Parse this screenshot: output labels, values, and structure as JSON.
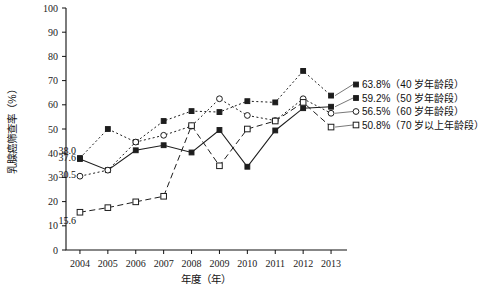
{
  "chart_data": {
    "type": "line",
    "title": "",
    "xlabel": "年度（年）",
    "ylabel": "乳腺癌筛查率（%）",
    "categories": [
      "2004",
      "2005",
      "2006",
      "2007",
      "2008",
      "2009",
      "2010",
      "2011",
      "2012",
      "2013"
    ],
    "x": [
      2004,
      2005,
      2006,
      2007,
      2008,
      2009,
      2010,
      2011,
      2012,
      2013
    ],
    "xlim": [
      2003.5,
      2013.5
    ],
    "ylim": [
      0,
      100
    ],
    "yticks": [
      0,
      10,
      20,
      30,
      40,
      50,
      60,
      70,
      80,
      90,
      100
    ],
    "ytick_labels": [
      "0",
      "10",
      "20",
      "30",
      "40",
      "50",
      "60",
      "70",
      "80",
      "90",
      "100"
    ],
    "grid": false,
    "legend_position": "right-inline",
    "series": [
      {
        "name": "40 岁年龄段",
        "end_label": "63.8%（40 岁年龄段）",
        "end_value": 63.8,
        "marker": "filled-square",
        "linestyle": "dotted",
        "values": [
          38.0,
          50.0,
          44.6,
          53.3,
          57.4,
          57.0,
          61.5,
          61.0,
          74.0,
          63.8
        ]
      },
      {
        "name": "50 岁年龄段",
        "end_label": "59.2%（50 岁年龄段）",
        "end_value": 59.2,
        "marker": "filled-square",
        "linestyle": "solid",
        "values": [
          37.6,
          33.0,
          41.2,
          43.3,
          40.3,
          49.6,
          34.4,
          49.4,
          58.6,
          59.2
        ]
      },
      {
        "name": "60 岁年龄段",
        "end_label": "56.5%（60 岁年龄段）",
        "end_value": 56.5,
        "marker": "open-circle",
        "linestyle": "dotted",
        "values": [
          30.5,
          33.0,
          44.6,
          47.4,
          51.2,
          62.5,
          55.6,
          53.5,
          62.5,
          56.5
        ]
      },
      {
        "name": "70 岁以上年龄段",
        "end_label": "50.8%（70 岁以上年龄段）",
        "end_value": 50.8,
        "marker": "open-square",
        "linestyle": "dashed",
        "values": [
          15.6,
          17.5,
          19.9,
          22.2,
          51.4,
          34.8,
          50.0,
          53.3,
          61.0,
          50.8
        ]
      }
    ],
    "point_labels": [
      {
        "text": "38.0",
        "series": "40 岁年龄段",
        "x": 2004,
        "y": 38.0
      },
      {
        "text": "37.6",
        "series": "50 岁年龄段",
        "x": 2004,
        "y": 37.6
      },
      {
        "text": "30.5",
        "series": "60 岁年龄段",
        "x": 2004,
        "y": 30.5
      },
      {
        "text": "15.6",
        "series": "70 岁以上年龄段",
        "x": 2004,
        "y": 15.6
      }
    ]
  }
}
